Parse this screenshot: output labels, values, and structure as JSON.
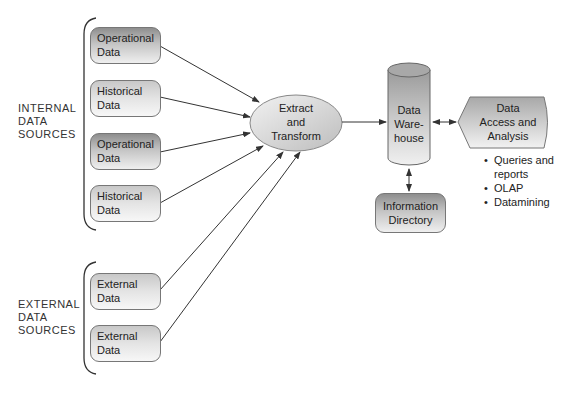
{
  "groups": {
    "internal": {
      "line1": "INTERNAL",
      "line2": "DATA",
      "line3": "SOURCES"
    },
    "external": {
      "line1": "EXTERNAL",
      "line2": "DATA",
      "line3": "SOURCES"
    }
  },
  "sources": [
    {
      "line1": "Operational",
      "line2": "Data"
    },
    {
      "line1": "Historical",
      "line2": "Data"
    },
    {
      "line1": "Operational",
      "line2": "Data"
    },
    {
      "line1": "Historical",
      "line2": "Data"
    },
    {
      "line1": "External",
      "line2": "Data"
    },
    {
      "line1": "External",
      "line2": "Data"
    }
  ],
  "extract": {
    "line1": "Extract",
    "line2": "and",
    "line3": "Transform"
  },
  "warehouse": {
    "line1": "Data",
    "line2": "Ware-",
    "line3": "house"
  },
  "directory": {
    "line1": "Information",
    "line2": "Directory"
  },
  "access": {
    "line1": "Data",
    "line2": "Access and",
    "line3": "Analysis"
  },
  "access_items": {
    "item1a": "Queries and",
    "item1b": "reports",
    "item2": "OLAP",
    "item3": "Datamining"
  },
  "colors": {
    "line": "#333333",
    "box_border": "#777777",
    "dark_fill": "#8e8e8e",
    "light_fill": "#efefef"
  }
}
